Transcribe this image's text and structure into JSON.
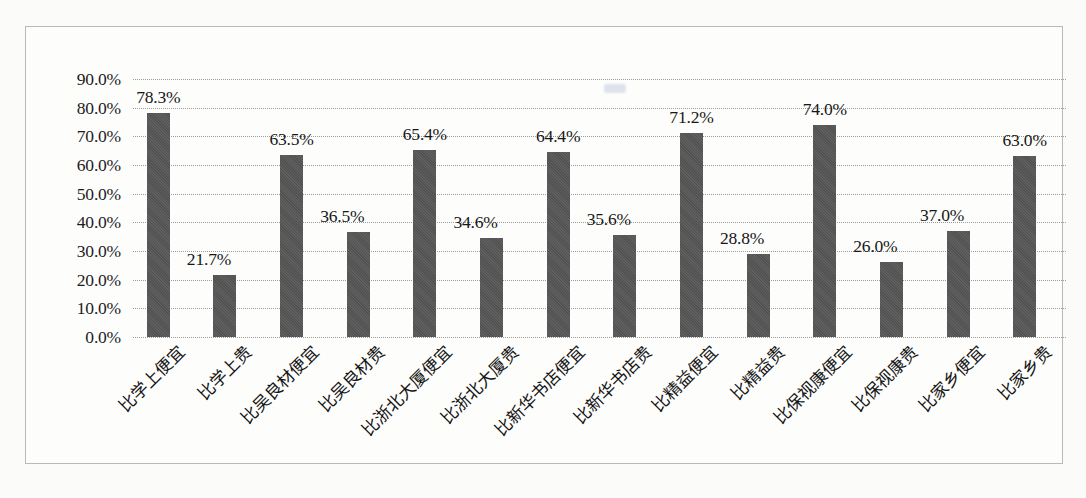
{
  "chart_data": {
    "type": "bar",
    "title": "",
    "subtitle": "",
    "xlabel": "",
    "ylabel": "",
    "ylim": [
      0,
      90
    ],
    "ytick_step": 10,
    "ytick_labels": [
      "0.0%",
      "10.0%",
      "20.0%",
      "30.0%",
      "40.0%",
      "50.0%",
      "60.0%",
      "70.0%",
      "80.0%",
      "90.0%"
    ],
    "ytick_values": [
      0,
      10,
      20,
      30,
      40,
      50,
      60,
      70,
      80,
      90
    ],
    "grid": true,
    "grid_axis": "y",
    "legend": false,
    "legend_position": "none",
    "bar_color": "#565656",
    "categories": [
      "比学上便宜",
      "比学上贵",
      "比吴良材便宜",
      "比吴良材贵",
      "比浙北大厦便宜",
      "比浙北大厦贵",
      "比新华书店便宜",
      "比新华书店贵",
      "比精益便宜",
      "比精益贵",
      "比保视康便宜",
      "比保视康贵",
      "比家乡便宜",
      "比家乡贵"
    ],
    "values": [
      78.3,
      21.7,
      63.5,
      36.5,
      65.4,
      34.6,
      64.4,
      35.6,
      71.2,
      28.8,
      74.0,
      26.0,
      37.0,
      63.0
    ],
    "data_labels": [
      "78.3%",
      "21.7%",
      "63.5%",
      "36.5%",
      "65.4%",
      "34.6%",
      "64.4%",
      "35.6%",
      "71.2%",
      "28.8%",
      "74.0%",
      "26.0%",
      "37.0%",
      "63.0%"
    ]
  }
}
